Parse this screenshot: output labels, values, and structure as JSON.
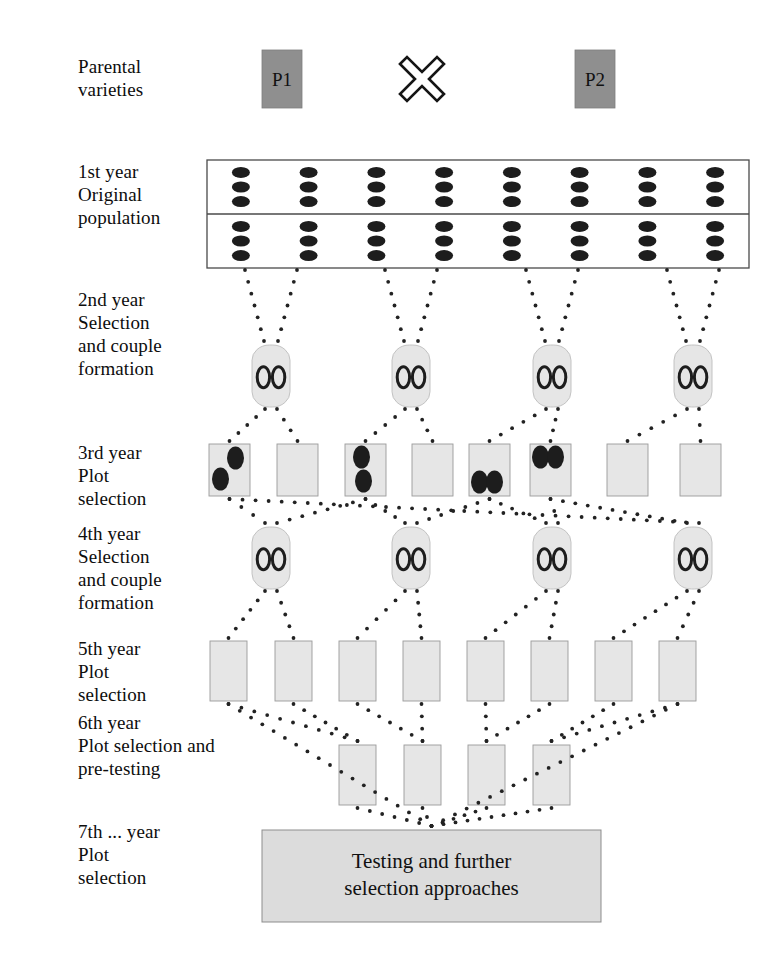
{
  "diagram": {
    "colors": {
      "parent_box_fill": "#8f8f8f",
      "plot_fill": "#e6e6e6",
      "plot_stroke": "#9a9a9a",
      "population_stroke": "#4a4a4a",
      "seed_fill": "#1d1d1d",
      "dotted_line": "#222222",
      "testing_box_fill": "#dcdcdc",
      "text": "#0d0d0d"
    },
    "stages": [
      {
        "id": "parental",
        "label": "Parental\nvarieties",
        "label_x": 78,
        "label_y": 55
      },
      {
        "id": "year1",
        "label": "1st year\nOriginal\npopulation",
        "label_x": 78,
        "label_y": 160
      },
      {
        "id": "year2",
        "label": "2nd year\nSelection\nand couple\nformation",
        "label_x": 78,
        "label_y": 288
      },
      {
        "id": "year3",
        "label": "3rd year\nPlot\nselection",
        "label_x": 78,
        "label_y": 441
      },
      {
        "id": "year4",
        "label": "4th year\nSelection\nand couple\nformation",
        "label_x": 78,
        "label_y": 522
      },
      {
        "id": "year5",
        "label": "5th year\nPlot\nselection",
        "label_x": 78,
        "label_y": 637
      },
      {
        "id": "year6",
        "label": "6th year\nPlot selection and\npre-testing",
        "label_x": 78,
        "label_y": 711
      },
      {
        "id": "year7",
        "label": "7th ... year\nPlot\nselection",
        "label_x": 78,
        "label_y": 820
      }
    ],
    "parents": [
      {
        "label": "P1",
        "x": 262,
        "y": 50,
        "w": 40,
        "h": 58
      },
      {
        "label": "P2",
        "x": 575,
        "y": 50,
        "w": 40,
        "h": 58
      }
    ],
    "cross_symbol": {
      "name": "cross-symbol",
      "cx": 422,
      "cy": 79,
      "size": 44
    },
    "population": {
      "x": 207,
      "y": 160,
      "w": 542,
      "h": 108,
      "divider_y": 214,
      "seed_rows": 6,
      "seed_cols": 8,
      "seed_rx": 9,
      "seed_ry": 5.5
    },
    "couples_year2": [
      {
        "x": 252,
        "y": 345,
        "w": 38,
        "h": 62
      },
      {
        "x": 392,
        "y": 345,
        "w": 38,
        "h": 62
      },
      {
        "x": 533,
        "y": 345,
        "w": 38,
        "h": 62
      },
      {
        "x": 674,
        "y": 345,
        "w": 38,
        "h": 62
      }
    ],
    "plots_year3": [
      {
        "x": 209,
        "y": 444,
        "w": 41,
        "h": 52,
        "seeds": 2,
        "arrangement": "diagonal"
      },
      {
        "x": 277,
        "y": 444,
        "w": 41,
        "h": 52,
        "seeds": 0,
        "arrangement": "none"
      },
      {
        "x": 345,
        "y": 444,
        "w": 41,
        "h": 52,
        "seeds": 2,
        "arrangement": "vertical"
      },
      {
        "x": 412,
        "y": 444,
        "w": 41,
        "h": 52,
        "seeds": 0,
        "arrangement": "none"
      },
      {
        "x": 469,
        "y": 444,
        "w": 41,
        "h": 52,
        "seeds": 2,
        "arrangement": "horizontal-low"
      },
      {
        "x": 530,
        "y": 444,
        "w": 41,
        "h": 52,
        "seeds": 2,
        "arrangement": "horizontal-high"
      },
      {
        "x": 607,
        "y": 444,
        "w": 41,
        "h": 52,
        "seeds": 0,
        "arrangement": "none"
      },
      {
        "x": 680,
        "y": 444,
        "w": 41,
        "h": 52,
        "seeds": 0,
        "arrangement": "none"
      }
    ],
    "couples_year4": [
      {
        "x": 252,
        "y": 527,
        "w": 38,
        "h": 62
      },
      {
        "x": 392,
        "y": 527,
        "w": 38,
        "h": 62
      },
      {
        "x": 533,
        "y": 527,
        "w": 38,
        "h": 62
      },
      {
        "x": 674,
        "y": 527,
        "w": 38,
        "h": 62
      }
    ],
    "plots_year5": [
      {
        "x": 210,
        "y": 641,
        "w": 37,
        "h": 60
      },
      {
        "x": 275,
        "y": 641,
        "w": 37,
        "h": 60
      },
      {
        "x": 339,
        "y": 641,
        "w": 37,
        "h": 60
      },
      {
        "x": 403,
        "y": 641,
        "w": 37,
        "h": 60
      },
      {
        "x": 467,
        "y": 641,
        "w": 37,
        "h": 60
      },
      {
        "x": 531,
        "y": 641,
        "w": 37,
        "h": 60
      },
      {
        "x": 595,
        "y": 641,
        "w": 37,
        "h": 60
      },
      {
        "x": 659,
        "y": 641,
        "w": 37,
        "h": 60
      }
    ],
    "plots_year6": [
      {
        "x": 339,
        "y": 745,
        "w": 37,
        "h": 60
      },
      {
        "x": 404,
        "y": 745,
        "w": 37,
        "h": 60
      },
      {
        "x": 468,
        "y": 745,
        "w": 37,
        "h": 60
      },
      {
        "x": 533,
        "y": 745,
        "w": 37,
        "h": 60
      }
    ],
    "testing_box": {
      "text": "Testing and further\nselection approaches",
      "line1": "Testing and further",
      "line2": "selection approaches",
      "x": 262,
      "y": 830,
      "w": 339,
      "h": 92
    }
  }
}
